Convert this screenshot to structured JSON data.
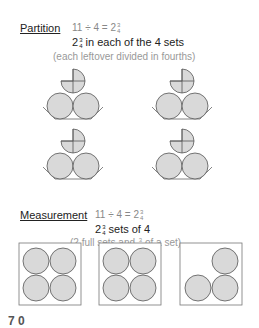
{
  "partition": {
    "heading": "Partition",
    "equation_prefix": "11 ÷ 4 = 2",
    "equation_frac_num": "3",
    "equation_frac_den": "4",
    "line2_whole": "2",
    "line2_frac_num": "3",
    "line2_frac_den": "4",
    "line2_text": " in each of the 4 sets",
    "line3": "(each leftover divided in fourths)",
    "groups": 4,
    "circles_per_group": 2,
    "partial_piece": "3/4 circle divided in quarters"
  },
  "measurement": {
    "heading": "Measurement",
    "equation_prefix": "11 ÷ 4 = 2",
    "equation_frac_num": "3",
    "equation_frac_den": "4",
    "line2_whole": "2",
    "line2_frac_num": "3",
    "line2_frac_den": "4",
    "line2_text": " sets of 4",
    "line3_a": "(2 full sets and ",
    "line3_frac_num": "3",
    "line3_frac_den": "4",
    "line3_b": " of a set)",
    "boxes": [
      {
        "circles": 4
      },
      {
        "circles": 4
      },
      {
        "circles": 3
      }
    ]
  },
  "footer_cut_text": "7 0",
  "colors": {
    "circle_fill": "#d9d9d9",
    "stroke": "#555555",
    "text_gray": "#888888"
  }
}
